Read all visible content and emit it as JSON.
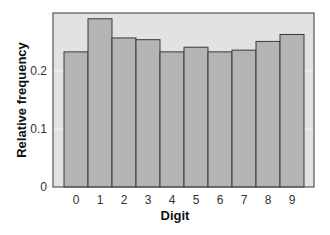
{
  "chart_data": {
    "type": "bar",
    "title": "",
    "xlabel": "Digit",
    "ylabel": "Relative frequency",
    "categories": [
      "0",
      "1",
      "2",
      "3",
      "4",
      "5",
      "6",
      "7",
      "8",
      "9"
    ],
    "values": [
      0.233,
      0.29,
      0.257,
      0.254,
      0.233,
      0.241,
      0.233,
      0.236,
      0.251,
      0.263
    ],
    "ylim": [
      0,
      0.3
    ],
    "yticks": [
      0,
      0.1,
      0.2
    ],
    "ytick_labels": [
      "0",
      "0.1",
      "0.2"
    ],
    "grid": true,
    "legend": null,
    "colors": {
      "plot_background": "#e2e2e2",
      "bar_fill": "#b4b4b4",
      "bar_edge": "#3a3a3a",
      "gridline": "#f4f4f4",
      "frame": "#555555"
    }
  }
}
